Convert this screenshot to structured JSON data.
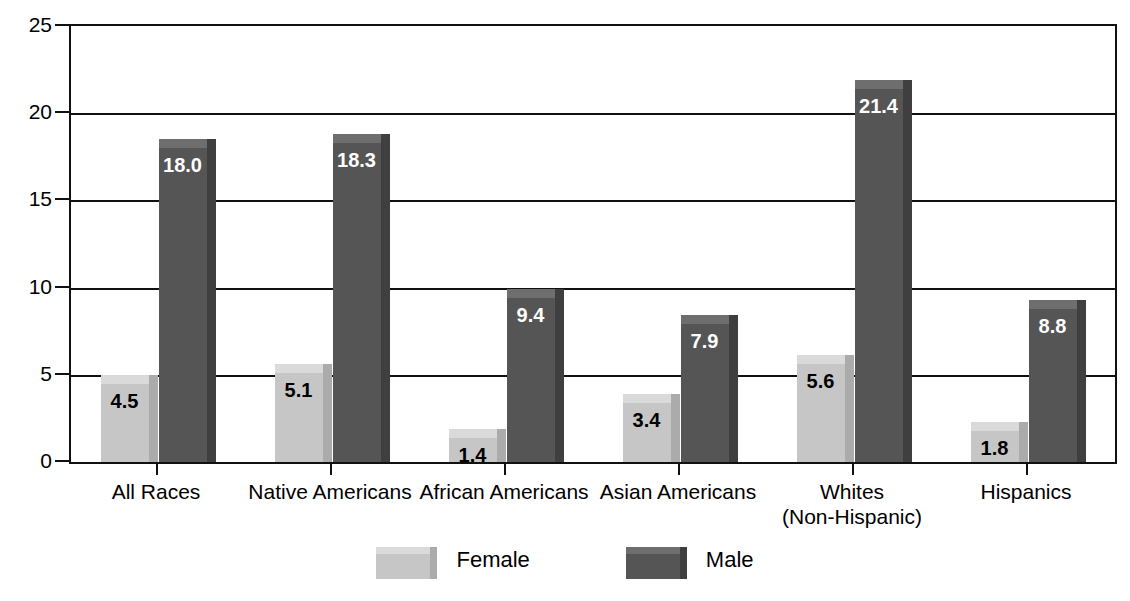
{
  "chart_data": {
    "type": "bar",
    "title": "",
    "subtitle": "",
    "xlabel": "",
    "ylabel": "",
    "ylim": [
      0,
      25
    ],
    "yticks": [
      0,
      5,
      10,
      15,
      20,
      25
    ],
    "ytick_labels": [
      "0",
      "5",
      "10",
      "15",
      "20",
      "25"
    ],
    "grid": true,
    "legend_position": "bottom",
    "categories": [
      "All Races",
      "Native Americans",
      "African Americans",
      "Asian Americans",
      "Whites\n(Non-Hispanic)",
      "Hispanics"
    ],
    "series": [
      {
        "name": "Female",
        "color": "#c6c6c6",
        "values": [
          4.5,
          5.1,
          1.4,
          3.4,
          5.6,
          1.8
        ],
        "labels": [
          "4.5",
          "5.1",
          "1.4",
          "3.4",
          "5.6",
          "1.8"
        ]
      },
      {
        "name": "Male",
        "color": "#555555",
        "values": [
          18.0,
          18.3,
          9.4,
          7.9,
          21.4,
          8.8
        ],
        "labels": [
          "18.0",
          "18.3",
          "9.4",
          "7.9",
          "21.4",
          "8.8"
        ]
      }
    ]
  },
  "legend": {
    "items": [
      {
        "label": "Female",
        "swatch": "female"
      },
      {
        "label": "Male",
        "swatch": "male"
      }
    ]
  },
  "colors": {
    "female_front": "#c6c6c6",
    "female_top": "#dadada",
    "female_side": "#ababab",
    "male_front": "#555555",
    "male_top": "#6e6e6e",
    "male_side": "#3f3f3f",
    "axis": "#111111",
    "background": "#ffffff"
  }
}
